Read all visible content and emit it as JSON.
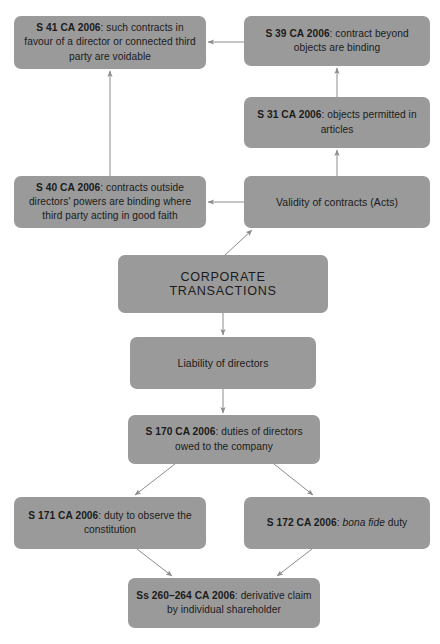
{
  "diagram": {
    "style": {
      "node_fill": "#9a9a9a",
      "node_text": "#1b1b1b",
      "edge_color": "#8c8c8c",
      "background": "#ffffff"
    },
    "nodes": [
      {
        "id": "s41",
        "statute": "S 41 CA 2006",
        "separator": ": ",
        "text": "such contracts in favour of a director or connected third party are voidable",
        "emphasis": "",
        "style": "statute",
        "x": 14,
        "y": 16,
        "w": 192,
        "h": 53
      },
      {
        "id": "s39",
        "statute": "S 39 CA 2006",
        "separator": ": ",
        "text": "contract beyond objects are binding",
        "emphasis": "",
        "style": "statute",
        "x": 244,
        "y": 16,
        "w": 186,
        "h": 50
      },
      {
        "id": "s31",
        "statute": "S 31 CA 2006",
        "separator": ": ",
        "text": "objects permitted in articles",
        "emphasis": "",
        "style": "statute",
        "x": 244,
        "y": 97,
        "w": 186,
        "h": 51
      },
      {
        "id": "validity",
        "statute": "",
        "separator": "",
        "text": "Validity of contracts (Acts)",
        "emphasis": "",
        "style": "plain",
        "x": 244,
        "y": 176,
        "w": 186,
        "h": 52
      },
      {
        "id": "s40",
        "statute": "S 40 CA 2006",
        "separator": ": ",
        "text": "contracts outside directors' powers are binding where third party acting in good faith",
        "emphasis": "",
        "style": "statute",
        "x": 14,
        "y": 176,
        "w": 192,
        "h": 52
      },
      {
        "id": "corporate",
        "statute": "",
        "separator": "",
        "text": "CORPORATE TRANSACTIONS",
        "emphasis": "",
        "style": "caps",
        "x": 118,
        "y": 255,
        "w": 210,
        "h": 58
      },
      {
        "id": "liability",
        "statute": "",
        "separator": "",
        "text": "Liability of directors",
        "emphasis": "",
        "style": "plain",
        "x": 130,
        "y": 337,
        "w": 186,
        "h": 52
      },
      {
        "id": "s170",
        "statute": "S 170 CA 2006",
        "separator": ": ",
        "text": "duties of directors owed to the company",
        "emphasis": "",
        "style": "statute",
        "x": 128,
        "y": 415,
        "w": 192,
        "h": 49
      },
      {
        "id": "s171",
        "statute": "S 171 CA 2006",
        "separator": ": ",
        "text": "duty to observe the constitution",
        "emphasis": "",
        "style": "statute",
        "x": 14,
        "y": 497,
        "w": 192,
        "h": 52
      },
      {
        "id": "s172",
        "statute": "S 172 CA 2006",
        "separator": ": ",
        "text": " duty",
        "emphasis": "bona fide",
        "style": "statute-italic",
        "x": 244,
        "y": 497,
        "w": 186,
        "h": 52
      },
      {
        "id": "ss260",
        "statute": "Ss 260–264 CA 2006",
        "separator": ": ",
        "text": "derivative claim by individual shareholder",
        "emphasis": "",
        "style": "statute",
        "x": 128,
        "y": 578,
        "w": 192,
        "h": 50
      }
    ],
    "edges": [
      {
        "from": "s39",
        "to": "s41",
        "kind": "horizontal-left",
        "x1": 244,
        "y1": 42,
        "x2": 208,
        "y2": 42
      },
      {
        "from": "s31",
        "to": "s39",
        "kind": "vertical-up",
        "x1": 337,
        "y1": 97,
        "x2": 337,
        "y2": 68
      },
      {
        "from": "validity",
        "to": "s31",
        "kind": "vertical-up",
        "x1": 337,
        "y1": 176,
        "x2": 337,
        "y2": 150
      },
      {
        "from": "validity",
        "to": "s40",
        "kind": "horizontal-left",
        "x1": 244,
        "y1": 202,
        "x2": 208,
        "y2": 202
      },
      {
        "from": "s40",
        "to": "s41",
        "kind": "vertical-up",
        "x1": 110,
        "y1": 176,
        "x2": 110,
        "y2": 71
      },
      {
        "from": "corporate",
        "to": "validity",
        "kind": "diagonal-up-right",
        "x1": 225,
        "y1": 255,
        "x2": 252,
        "y2": 230
      },
      {
        "from": "corporate",
        "to": "liability",
        "kind": "vertical-down",
        "x1": 223,
        "y1": 313,
        "x2": 223,
        "y2": 335
      },
      {
        "from": "liability",
        "to": "s170",
        "kind": "vertical-down",
        "x1": 223,
        "y1": 389,
        "x2": 223,
        "y2": 413
      },
      {
        "from": "s170",
        "to": "s171",
        "kind": "diagonal-down-left",
        "x1": 175,
        "y1": 464,
        "x2": 135,
        "y2": 495
      },
      {
        "from": "s170",
        "to": "s172",
        "kind": "diagonal-down-right",
        "x1": 274,
        "y1": 464,
        "x2": 313,
        "y2": 495
      },
      {
        "from": "s171",
        "to": "ss260",
        "kind": "diagonal-down-right",
        "x1": 137,
        "y1": 549,
        "x2": 172,
        "y2": 576
      },
      {
        "from": "s172",
        "to": "ss260",
        "kind": "diagonal-down-left",
        "x1": 312,
        "y1": 549,
        "x2": 277,
        "y2": 576
      }
    ]
  }
}
